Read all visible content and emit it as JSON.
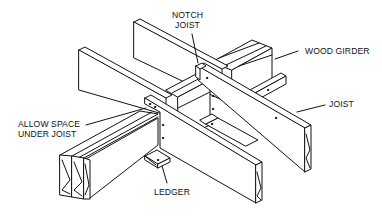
{
  "diagram": {
    "type": "isometric framing detail",
    "colors": {
      "line": "#111111",
      "fill": "#ffffff",
      "background": "#ffffff"
    }
  },
  "labels": {
    "notch_joist": {
      "line1": "NOTCH",
      "line2": "JOIST"
    },
    "wood_girder": "WOOD GIRDER",
    "joist": "JOIST",
    "allow_space": {
      "line1": "ALLOW SPACE",
      "line2": "UNDER JOIST"
    },
    "ledger": "LEDGER"
  }
}
